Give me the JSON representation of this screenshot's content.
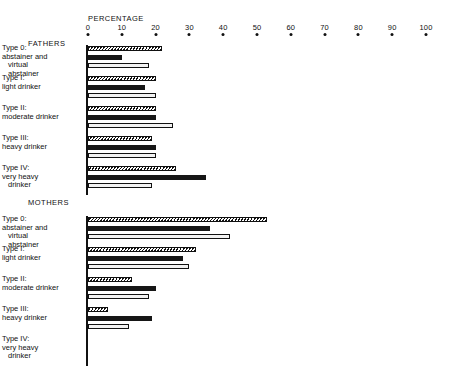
{
  "chart_data": {
    "type": "bar",
    "orientation": "horizontal",
    "title": "",
    "xlabel": "PERCENTAGE",
    "ylabel": "",
    "xlim": [
      0,
      100
    ],
    "xticks": [
      0,
      10,
      20,
      30,
      40,
      50,
      60,
      70,
      80,
      90,
      100
    ],
    "xtick_labels": [
      "0",
      "10",
      "20",
      "30",
      "40",
      "50",
      "60",
      "70",
      "80",
      "90",
      "100"
    ],
    "grid": false,
    "legend": "none",
    "series_styles": [
      "hatched",
      "solid-black",
      "white-outline"
    ],
    "panels": [
      {
        "name": "FATHERS",
        "categories": [
          "Type 0: abstainer and virtual abstainer",
          "Type I: light drinker",
          "Type II: moderate drinker",
          "Type III: heavy drinker",
          "Type IV: very heavy drinker"
        ],
        "series": [
          {
            "name": "series-1",
            "style": "hatched",
            "values": [
              22,
              20,
              20,
              19,
              26
            ]
          },
          {
            "name": "series-2",
            "style": "solid-black",
            "values": [
              10,
              17,
              20,
              20,
              35
            ]
          },
          {
            "name": "series-3",
            "style": "white-outline",
            "values": [
              18,
              20,
              25,
              20,
              19
            ]
          }
        ]
      },
      {
        "name": "MOTHERS",
        "categories": [
          "Type 0: abstainer and virtual abstainer",
          "Type I: light drinker",
          "Type II: moderate drinker",
          "Type III: heavy drinker",
          "Type IV: very heavy drinker"
        ],
        "series": [
          {
            "name": "series-1",
            "style": "hatched",
            "values": [
              53,
              32,
              13,
              6,
              0
            ]
          },
          {
            "name": "series-2",
            "style": "solid-black",
            "values": [
              36,
              28,
              20,
              19,
              0
            ]
          },
          {
            "name": "series-3",
            "style": "white-outline",
            "values": [
              42,
              30,
              18,
              12,
              0
            ]
          }
        ]
      }
    ]
  },
  "axis": {
    "title": "PERCENTAGE",
    "ticks": [
      {
        "label": "0",
        "value": 0
      },
      {
        "label": "10",
        "value": 10
      },
      {
        "label": "20",
        "value": 20
      },
      {
        "label": "30",
        "value": 30
      },
      {
        "label": "40",
        "value": 40
      },
      {
        "label": "50",
        "value": 50
      },
      {
        "label": "60",
        "value": 60
      },
      {
        "label": "70",
        "value": 70
      },
      {
        "label": "80",
        "value": 80
      },
      {
        "label": "90",
        "value": 90
      },
      {
        "label": "100",
        "value": 100
      }
    ]
  },
  "panels": {
    "fathers": {
      "title": "FATHERS",
      "categories": [
        {
          "lines": [
            "Type 0:",
            "abstainer and",
            "virtual",
            "abstainer"
          ],
          "indents": [
            0,
            0,
            1,
            1
          ]
        },
        {
          "lines": [
            "Type I:",
            "light drinker"
          ],
          "indents": [
            0,
            0
          ]
        },
        {
          "lines": [
            "Type II:",
            "moderate drinker"
          ],
          "indents": [
            0,
            0
          ]
        },
        {
          "lines": [
            "Type III:",
            "heavy drinker"
          ],
          "indents": [
            0,
            0
          ]
        },
        {
          "lines": [
            "Type IV:",
            "very heavy",
            "drinker"
          ],
          "indents": [
            0,
            0,
            1
          ]
        }
      ]
    },
    "mothers": {
      "title": "MOTHERS",
      "categories": [
        {
          "lines": [
            "Type 0:",
            "abstainer and",
            "virtual",
            "abstainer"
          ],
          "indents": [
            0,
            0,
            1,
            1
          ]
        },
        {
          "lines": [
            "Type I:",
            "light drinker"
          ],
          "indents": [
            0,
            0
          ]
        },
        {
          "lines": [
            "Type II:",
            "moderate drinker"
          ],
          "indents": [
            0,
            0
          ]
        },
        {
          "lines": [
            "Type III:",
            "heavy drinker"
          ],
          "indents": [
            0,
            0
          ]
        },
        {
          "lines": [
            "Type IV:",
            "very heavy",
            "drinker"
          ],
          "indents": [
            0,
            0,
            1
          ]
        }
      ]
    }
  },
  "colors": {
    "ink": "#111111",
    "solid_bar": "#161616",
    "open_bar": "#f2f2f2",
    "background": "#ffffff"
  }
}
